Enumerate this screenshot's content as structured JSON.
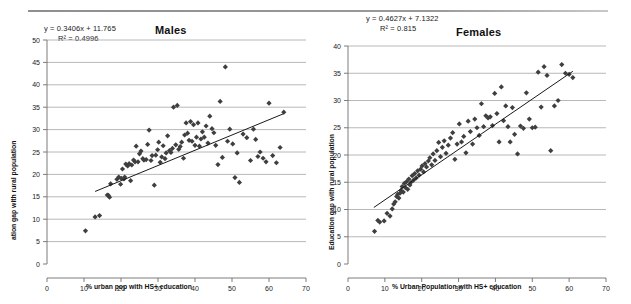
{
  "figure": {
    "background_color": "#ffffff",
    "marker_color": "#3f3f3f",
    "grid_color": "#a6a6a6",
    "trendline_color": "#1a1a1a",
    "top_rule": "horizontal-rule"
  },
  "chart_data": [
    {
      "type": "scatter",
      "id": "males",
      "title": "Males",
      "xlabel": "% urban pop with HS+ education",
      "ylabel": "ation gap with rural population",
      "ylabel_full": "Education gap with rural population",
      "xlim": [
        0,
        70
      ],
      "ylim": [
        0,
        50
      ],
      "xticks": [
        0,
        10,
        20,
        30,
        40,
        50,
        60,
        70
      ],
      "yticks": [
        0,
        5,
        10,
        15,
        20,
        25,
        30,
        35,
        40,
        45,
        50
      ],
      "grid": "horizontal",
      "legend": "none",
      "annotations": {
        "equation": "y = 0.3406x + 11.765",
        "r_squared": "R² = 0.4996"
      },
      "trendline": {
        "slope": 0.3406,
        "intercept": 11.765,
        "x_start": 13,
        "x_end": 64
      },
      "points": [
        [
          10.4,
          7.4
        ],
        [
          13.0,
          10.5
        ],
        [
          14.2,
          10.8
        ],
        [
          16.3,
          15.4
        ],
        [
          16.6,
          15.3
        ],
        [
          16.9,
          14.9
        ],
        [
          17.2,
          17.9
        ],
        [
          18.9,
          18.9
        ],
        [
          19.4,
          19.4
        ],
        [
          19.9,
          17.8
        ],
        [
          20.1,
          19.1
        ],
        [
          20.4,
          21.2
        ],
        [
          20.8,
          19.0
        ],
        [
          21.0,
          19.4
        ],
        [
          21.3,
          22.3
        ],
        [
          21.8,
          21.9
        ],
        [
          22.2,
          22.4
        ],
        [
          22.6,
          18.6
        ],
        [
          22.9,
          22.1
        ],
        [
          23.4,
          23.2
        ],
        [
          23.8,
          22.8
        ],
        [
          24.1,
          26.3
        ],
        [
          24.6,
          22.8
        ],
        [
          25.0,
          24.6
        ],
        [
          25.4,
          25.2
        ],
        [
          25.9,
          23.5
        ],
        [
          26.2,
          23.2
        ],
        [
          26.8,
          23.3
        ],
        [
          27.2,
          26.7
        ],
        [
          27.6,
          29.9
        ],
        [
          28.1,
          23.1
        ],
        [
          28.4,
          24.2
        ],
        [
          29.0,
          17.6
        ],
        [
          29.4,
          24.3
        ],
        [
          29.9,
          25.5
        ],
        [
          30.2,
          27.2
        ],
        [
          30.6,
          22.7
        ],
        [
          31.0,
          23.9
        ],
        [
          31.4,
          26.4
        ],
        [
          31.9,
          23.5
        ],
        [
          32.2,
          24.8
        ],
        [
          32.6,
          28.6
        ],
        [
          33.1,
          25.3
        ],
        [
          33.5,
          24.9
        ],
        [
          33.9,
          25.8
        ],
        [
          34.2,
          35.0
        ],
        [
          34.8,
          26.6
        ],
        [
          35.2,
          35.4
        ],
        [
          35.6,
          25.6
        ],
        [
          36.0,
          26.2
        ],
        [
          36.4,
          27.2
        ],
        [
          36.9,
          23.6
        ],
        [
          37.2,
          28.8
        ],
        [
          37.6,
          31.5
        ],
        [
          38.0,
          29.2
        ],
        [
          38.4,
          27.6
        ],
        [
          38.8,
          31.8
        ],
        [
          39.2,
          27.4
        ],
        [
          39.6,
          31.1
        ],
        [
          40.0,
          26.5
        ],
        [
          40.4,
          28.3
        ],
        [
          40.8,
          31.5
        ],
        [
          41.2,
          26.3
        ],
        [
          41.6,
          27.9
        ],
        [
          42.0,
          29.5
        ],
        [
          42.5,
          28.3
        ],
        [
          43.0,
          30.8
        ],
        [
          43.5,
          27.0
        ],
        [
          44.0,
          33.0
        ],
        [
          44.6,
          30.2
        ],
        [
          45.1,
          29.3
        ],
        [
          45.6,
          26.5
        ],
        [
          46.2,
          22.2
        ],
        [
          46.8,
          36.3
        ],
        [
          47.4,
          23.8
        ],
        [
          48.2,
          44.0
        ],
        [
          48.8,
          27.4
        ],
        [
          49.4,
          30.1
        ],
        [
          50.2,
          26.8
        ],
        [
          50.8,
          19.3
        ],
        [
          51.4,
          24.8
        ],
        [
          52.0,
          18.2
        ],
        [
          53.0,
          29.0
        ],
        [
          54.0,
          28.2
        ],
        [
          55.0,
          23.1
        ],
        [
          55.8,
          30.1
        ],
        [
          56.4,
          27.8
        ],
        [
          57.0,
          24.0
        ],
        [
          57.6,
          25.0
        ],
        [
          58.4,
          23.6
        ],
        [
          59.2,
          22.8
        ],
        [
          60.0,
          35.9
        ],
        [
          61.0,
          24.2
        ],
        [
          62.0,
          22.6
        ],
        [
          63.0,
          26.0
        ],
        [
          64.0,
          33.9
        ]
      ]
    },
    {
      "type": "scatter",
      "id": "females",
      "title": "Females",
      "xlabel": "% Urban Population with HS+ education",
      "ylabel": "Education gap with rural population",
      "xlim": [
        0,
        70
      ],
      "ylim": [
        0,
        40
      ],
      "xticks": [
        0,
        10,
        20,
        30,
        40,
        50,
        60,
        70
      ],
      "yticks": [
        0,
        5,
        10,
        15,
        20,
        25,
        30,
        35,
        40
      ],
      "grid": "horizontal",
      "legend": "none",
      "annotations": {
        "equation": "y = 0.4627x + 7.1322",
        "r_squared": "R² = 0.815"
      },
      "trendline": {
        "slope": 0.4627,
        "intercept": 7.1322,
        "x_start": 7,
        "x_end": 61
      },
      "points": [
        [
          7.2,
          6.0
        ],
        [
          8.1,
          8.0
        ],
        [
          8.6,
          7.7
        ],
        [
          9.8,
          7.9
        ],
        [
          10.6,
          9.3
        ],
        [
          11.4,
          8.8
        ],
        [
          12.0,
          10.1
        ],
        [
          12.4,
          11.0
        ],
        [
          12.8,
          11.4
        ],
        [
          13.2,
          12.4
        ],
        [
          13.5,
          12.8
        ],
        [
          13.8,
          12.1
        ],
        [
          14.1,
          13.0
        ],
        [
          14.4,
          13.5
        ],
        [
          14.7,
          14.2
        ],
        [
          15.0,
          13.2
        ],
        [
          15.3,
          14.8
        ],
        [
          15.6,
          14.0
        ],
        [
          15.9,
          15.1
        ],
        [
          16.2,
          13.7
        ],
        [
          16.5,
          15.6
        ],
        [
          16.8,
          14.5
        ],
        [
          17.1,
          15.0
        ],
        [
          17.4,
          16.2
        ],
        [
          17.8,
          15.4
        ],
        [
          18.1,
          16.6
        ],
        [
          18.5,
          15.8
        ],
        [
          18.9,
          17.1
        ],
        [
          19.3,
          16.3
        ],
        [
          19.7,
          17.4
        ],
        [
          20.1,
          18.0
        ],
        [
          20.5,
          16.9
        ],
        [
          20.9,
          18.4
        ],
        [
          21.3,
          17.8
        ],
        [
          21.8,
          18.9
        ],
        [
          22.2,
          19.5
        ],
        [
          22.7,
          18.2
        ],
        [
          23.1,
          20.2
        ],
        [
          23.6,
          19.0
        ],
        [
          24.1,
          20.8
        ],
        [
          24.6,
          22.3
        ],
        [
          25.1,
          19.7
        ],
        [
          25.6,
          21.4
        ],
        [
          26.1,
          22.6
        ],
        [
          26.6,
          20.3
        ],
        [
          27.2,
          21.8
        ],
        [
          27.8,
          23.1
        ],
        [
          28.4,
          24.1
        ],
        [
          29.0,
          19.2
        ],
        [
          29.6,
          22.0
        ],
        [
          30.2,
          25.7
        ],
        [
          30.8,
          22.4
        ],
        [
          31.4,
          23.4
        ],
        [
          32.0,
          20.4
        ],
        [
          32.6,
          26.2
        ],
        [
          33.2,
          24.3
        ],
        [
          33.8,
          22.0
        ],
        [
          34.4,
          26.6
        ],
        [
          35.0,
          25.0
        ],
        [
          35.6,
          23.6
        ],
        [
          36.2,
          29.4
        ],
        [
          36.8,
          25.2
        ],
        [
          37.4,
          27.2
        ],
        [
          38.0,
          26.8
        ],
        [
          38.6,
          27.0
        ],
        [
          39.2,
          25.4
        ],
        [
          39.8,
          31.3
        ],
        [
          40.4,
          27.6
        ],
        [
          41.0,
          22.4
        ],
        [
          41.6,
          32.5
        ],
        [
          42.2,
          26.3
        ],
        [
          42.8,
          29.0
        ],
        [
          43.4,
          25.2
        ],
        [
          44.0,
          22.4
        ],
        [
          44.6,
          28.7
        ],
        [
          45.2,
          23.8
        ],
        [
          46.0,
          20.2
        ],
        [
          46.8,
          25.3
        ],
        [
          47.6,
          24.9
        ],
        [
          48.4,
          31.4
        ],
        [
          49.2,
          26.6
        ],
        [
          50.0,
          25.0
        ],
        [
          50.8,
          25.1
        ],
        [
          51.6,
          35.2
        ],
        [
          52.4,
          28.8
        ],
        [
          53.2,
          36.2
        ],
        [
          54.0,
          34.6
        ],
        [
          55.0,
          20.8
        ],
        [
          56.0,
          29.0
        ],
        [
          57.0,
          30.0
        ],
        [
          58.0,
          36.6
        ],
        [
          59.0,
          35.0
        ],
        [
          60.0,
          34.8
        ],
        [
          61.0,
          34.2
        ]
      ]
    }
  ]
}
